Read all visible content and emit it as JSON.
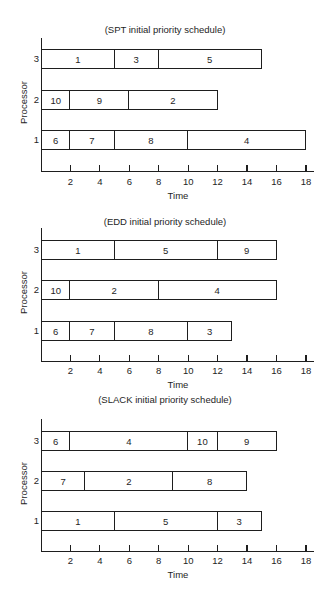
{
  "chart_data": [
    {
      "type": "gantt",
      "title": "(SPT initial priority schedule)",
      "xlabel": "Time",
      "ylabel": "Processor",
      "xlim": [
        0,
        18
      ],
      "xticks": [
        2,
        4,
        6,
        8,
        10,
        12,
        14,
        16,
        18
      ],
      "processors": [
        {
          "name": "3",
          "jobs": [
            {
              "job": "1",
              "start": 0,
              "end": 5
            },
            {
              "job": "3",
              "start": 5,
              "end": 8
            },
            {
              "job": "5",
              "start": 8,
              "end": 15
            }
          ]
        },
        {
          "name": "2",
          "jobs": [
            {
              "job": "10",
              "start": 0,
              "end": 2
            },
            {
              "job": "9",
              "start": 2,
              "end": 6
            },
            {
              "job": "2",
              "start": 6,
              "end": 12
            }
          ]
        },
        {
          "name": "1",
          "jobs": [
            {
              "job": "6",
              "start": 0,
              "end": 2
            },
            {
              "job": "7",
              "start": 2,
              "end": 5
            },
            {
              "job": "8",
              "start": 5,
              "end": 10
            },
            {
              "job": "4",
              "start": 10,
              "end": 18
            }
          ]
        }
      ]
    },
    {
      "type": "gantt",
      "title": "(EDD initial priority schedule)",
      "xlabel": "Time",
      "ylabel": "Processor",
      "xlim": [
        0,
        18
      ],
      "xticks": [
        2,
        4,
        6,
        8,
        10,
        12,
        14,
        16,
        18
      ],
      "processors": [
        {
          "name": "3",
          "jobs": [
            {
              "job": "1",
              "start": 0,
              "end": 5
            },
            {
              "job": "5",
              "start": 5,
              "end": 12
            },
            {
              "job": "9",
              "start": 12,
              "end": 16
            }
          ]
        },
        {
          "name": "2",
          "jobs": [
            {
              "job": "10",
              "start": 0,
              "end": 2
            },
            {
              "job": "2",
              "start": 2,
              "end": 8
            },
            {
              "job": "4",
              "start": 8,
              "end": 16
            }
          ]
        },
        {
          "name": "1",
          "jobs": [
            {
              "job": "6",
              "start": 0,
              "end": 2
            },
            {
              "job": "7",
              "start": 2,
              "end": 5
            },
            {
              "job": "8",
              "start": 5,
              "end": 10
            },
            {
              "job": "3",
              "start": 10,
              "end": 13
            }
          ]
        }
      ]
    },
    {
      "type": "gantt",
      "title": "(SLACK initial priority schedule)",
      "xlabel": "Time",
      "ylabel": "Processor",
      "xlim": [
        0,
        18
      ],
      "xticks": [
        2,
        4,
        6,
        8,
        10,
        12,
        14,
        16,
        18
      ],
      "processors": [
        {
          "name": "3",
          "jobs": [
            {
              "job": "6",
              "start": 0,
              "end": 2
            },
            {
              "job": "4",
              "start": 2,
              "end": 10
            },
            {
              "job": "10",
              "start": 10,
              "end": 12
            },
            {
              "job": "9",
              "start": 12,
              "end": 16
            }
          ]
        },
        {
          "name": "2",
          "jobs": [
            {
              "job": "7",
              "start": 0,
              "end": 3
            },
            {
              "job": "2",
              "start": 3,
              "end": 9
            },
            {
              "job": "8",
              "start": 9,
              "end": 14
            }
          ]
        },
        {
          "name": "1",
          "jobs": [
            {
              "job": "1",
              "start": 0,
              "end": 5
            },
            {
              "job": "5",
              "start": 5,
              "end": 12
            },
            {
              "job": "3",
              "start": 12,
              "end": 15
            }
          ]
        }
      ]
    }
  ],
  "layout": {
    "charts": [
      {
        "title_y": 24,
        "axis_top": 38,
        "rows_y": [
          49,
          90,
          130
        ],
        "xaxis_y": 171,
        "ticklabel_y": 176,
        "xlabel_y": 190,
        "ylabel_y": 102
      },
      {
        "title_y": 216,
        "axis_top": 228,
        "rows_y": [
          240,
          280,
          321
        ],
        "xaxis_y": 361,
        "ticklabel_y": 365,
        "xlabel_y": 379,
        "ylabel_y": 292
      },
      {
        "title_y": 394,
        "axis_top": 419,
        "rows_y": [
          431,
          471,
          511
        ],
        "xaxis_y": 551,
        "ticklabel_y": 555,
        "xlabel_y": 569,
        "ylabel_y": 483
      }
    ],
    "x0": 41,
    "px_per_unit": 14.72
  }
}
